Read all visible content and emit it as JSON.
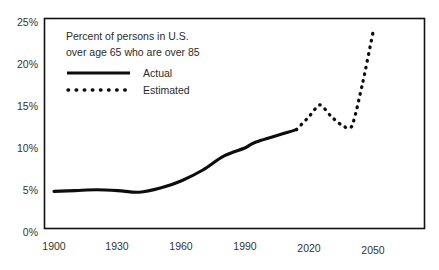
{
  "chart_data": {
    "type": "line",
    "title": "",
    "annotation": {
      "line1": "Percent of persons in U.S.",
      "line2": "over age 65 who are over 85"
    },
    "xlabel": "",
    "ylabel": "",
    "xlim": [
      1900,
      2050
    ],
    "ylim": [
      0,
      25
    ],
    "grid": false,
    "legend_position": "top-left-inside",
    "x_ticks": [
      "1900",
      "1930",
      "1960",
      "1990",
      "2020",
      "2050"
    ],
    "x_tick_values": [
      1900,
      1930,
      1960,
      1990,
      2020,
      2050
    ],
    "y_ticks": [
      "0%",
      "5%",
      "10%",
      "15%",
      "20%",
      "25%"
    ],
    "y_tick_values": [
      0,
      5,
      10,
      15,
      20,
      25
    ],
    "series": [
      {
        "name": "Actual",
        "style": "solid",
        "color": "#0d0d0d",
        "x": [
          1900,
          1910,
          1920,
          1930,
          1940,
          1950,
          1960,
          1970,
          1980,
          1990,
          1995,
          2014
        ],
        "values": [
          4.5,
          4.6,
          4.7,
          4.6,
          4.4,
          4.9,
          5.8,
          7.1,
          8.8,
          9.8,
          10.5,
          12.0
        ]
      },
      {
        "name": "Estimated",
        "style": "dotted",
        "color": "#0d0d0d",
        "x": [
          2014,
          2020,
          2025,
          2030,
          2035,
          2040,
          2045,
          2050
        ],
        "values": [
          12.0,
          13.6,
          15.0,
          13.7,
          12.6,
          12.4,
          17.5,
          23.8
        ]
      }
    ]
  },
  "legend": {
    "items": [
      {
        "label": "Actual",
        "style": "solid"
      },
      {
        "label": "Estimated",
        "style": "dotted"
      }
    ]
  }
}
